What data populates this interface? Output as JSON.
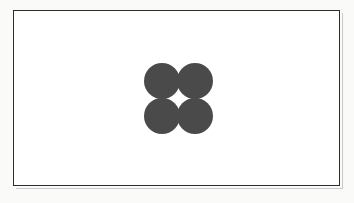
{
  "figure": {
    "background_color": "#ffffff",
    "page_color": "#fafaf9",
    "frame": {
      "border_color": "#2e2e2e",
      "shadow_color": "#c9c9c9"
    },
    "shapes": {
      "kind": "circle",
      "count": 4,
      "arrangement": "2x2 grid",
      "fill_color": "#4a4a4a",
      "diameter_px": 36,
      "items": [
        {
          "id": "circle-top-left",
          "position": "top-left"
        },
        {
          "id": "circle-top-right",
          "position": "top-right"
        },
        {
          "id": "circle-bottom-left",
          "position": "bottom-left"
        },
        {
          "id": "circle-bottom-right",
          "position": "bottom-right"
        }
      ]
    }
  }
}
